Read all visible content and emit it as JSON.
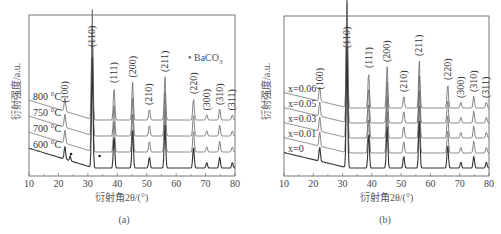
{
  "chart_data": [
    {
      "type": "line",
      "panel": "(a)",
      "title": "",
      "xlabel": "衍射角2θ/(°)",
      "ylabel": "衍射强度/a.u.",
      "xlim": [
        10,
        80
      ],
      "xticks": [
        10,
        20,
        30,
        40,
        50,
        60,
        70,
        80
      ],
      "grid": false,
      "series": [
        {
          "name": "800 °C",
          "offset": 3
        },
        {
          "name": "750 °C",
          "offset": 2
        },
        {
          "name": "700 °C",
          "offset": 1
        },
        {
          "name": "600 °C",
          "offset": 0
        }
      ],
      "peaks": [
        {
          "hkl": "(100)",
          "two_theta": 22.2,
          "height": 0.12
        },
        {
          "hkl": "(110)",
          "two_theta": 31.5,
          "height": 1.0
        },
        {
          "hkl": "(111)",
          "two_theta": 38.9,
          "height": 0.3
        },
        {
          "hkl": "(200)",
          "two_theta": 45.2,
          "height": 0.35
        },
        {
          "hkl": "(210)",
          "two_theta": 50.9,
          "height": 0.1
        },
        {
          "hkl": "(211)",
          "two_theta": 56.2,
          "height": 0.4
        },
        {
          "hkl": "(220)",
          "two_theta": 65.9,
          "height": 0.2
        },
        {
          "hkl": "(300)",
          "two_theta": 70.4,
          "height": 0.05
        },
        {
          "hkl": "(310)",
          "two_theta": 74.8,
          "height": 0.1
        },
        {
          "hkl": "(311)",
          "two_theta": 79.1,
          "height": 0.05
        }
      ],
      "annotations": [
        {
          "text": "• BaCO3",
          "note": "impurity marker; dots near 24° and 34° on 600 °C curve"
        }
      ]
    },
    {
      "type": "line",
      "panel": "(b)",
      "title": "",
      "xlabel": "衍射角2θ/(°)",
      "ylabel": "衍射强度/a.u.",
      "xlim": [
        10,
        80
      ],
      "xticks": [
        10,
        20,
        30,
        40,
        50,
        60,
        70,
        80
      ],
      "grid": false,
      "series": [
        {
          "name": "x=0.06",
          "offset": 4
        },
        {
          "name": "x=0.05",
          "offset": 3
        },
        {
          "name": "x=0.03",
          "offset": 2
        },
        {
          "name": "x=0.01",
          "offset": 1
        },
        {
          "name": "x=0",
          "offset": 0
        }
      ],
      "peaks": [
        {
          "hkl": "(100)",
          "two_theta": 22.2,
          "height": 0.12
        },
        {
          "hkl": "(110)",
          "two_theta": 31.5,
          "height": 1.0
        },
        {
          "hkl": "(111)",
          "two_theta": 38.9,
          "height": 0.3
        },
        {
          "hkl": "(200)",
          "two_theta": 45.2,
          "height": 0.35
        },
        {
          "hkl": "(210)",
          "two_theta": 50.9,
          "height": 0.1
        },
        {
          "hkl": "(211)",
          "two_theta": 56.2,
          "height": 0.4
        },
        {
          "hkl": "(220)",
          "two_theta": 65.9,
          "height": 0.2
        },
        {
          "hkl": "(300)",
          "two_theta": 70.4,
          "height": 0.05
        },
        {
          "hkl": "(310)",
          "two_theta": 74.8,
          "height": 0.1
        },
        {
          "hkl": "(311)",
          "two_theta": 79.1,
          "height": 0.05
        }
      ]
    }
  ],
  "captions": {
    "a": "(a)",
    "b": "(b)"
  },
  "labels": {
    "ylabel": "衍射强度/a.u.",
    "xlabel": "衍射角2θ/(°)",
    "bac": "• BaCO",
    "bac_sub": "3"
  }
}
